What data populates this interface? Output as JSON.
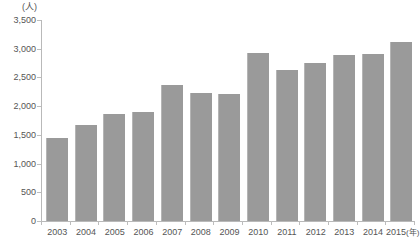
{
  "chart_data": {
    "type": "bar",
    "title": "",
    "subtitle": "",
    "xlabel": "(年)",
    "ylabel": "(人)",
    "unit_label": "(人)",
    "year_suffix": "(年)",
    "categories": [
      "2003",
      "2004",
      "2005",
      "2006",
      "2007",
      "2008",
      "2009",
      "2010",
      "2011",
      "2012",
      "2013",
      "2014",
      "2015"
    ],
    "values": [
      1450,
      1670,
      1870,
      1900,
      2370,
      2230,
      2220,
      2930,
      2630,
      2760,
      2890,
      2900,
      3120
    ],
    "ylim": [
      0,
      3500
    ],
    "ytick_values": [
      0,
      500,
      1000,
      1500,
      2000,
      2500,
      3000,
      3500
    ],
    "ytick_labels": [
      "0",
      "500",
      "1,000",
      "1,500",
      "2,000",
      "2,500",
      "3,000",
      "3,500"
    ],
    "grid": false,
    "legend": false,
    "legend_position": "none",
    "bar_color": "#9a9a9a",
    "axis_color": "#b9b9b9",
    "background_color": "#ffffff"
  }
}
